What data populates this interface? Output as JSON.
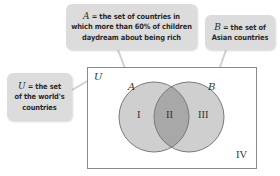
{
  "diagram": {
    "type": "venn",
    "universe": {
      "symbol": "U",
      "callout": {
        "symbol": "U",
        "text_line1": "= the set",
        "text_line2": "of the world's",
        "text_line3": "countries"
      }
    },
    "sets": [
      {
        "symbol": "A",
        "callout": {
          "symbol": "A",
          "text_line1": "= the set of countries in",
          "text_line2": "which more than 60% of children",
          "text_line3": "daydream about being rich"
        }
      },
      {
        "symbol": "B",
        "callout": {
          "symbol": "B",
          "text_line1": "= the set of",
          "text_line2": "Asian countries"
        }
      }
    ],
    "regions": [
      "I",
      "II",
      "III",
      "IV"
    ],
    "colors": {
      "circle_fill": "#cfcfcf",
      "overlap_fill": "#a8a8a8",
      "circle_stroke": "#7a7a7a",
      "callout_bg": "#dcdcdc",
      "rect_stroke": "#8a8a8a"
    }
  }
}
